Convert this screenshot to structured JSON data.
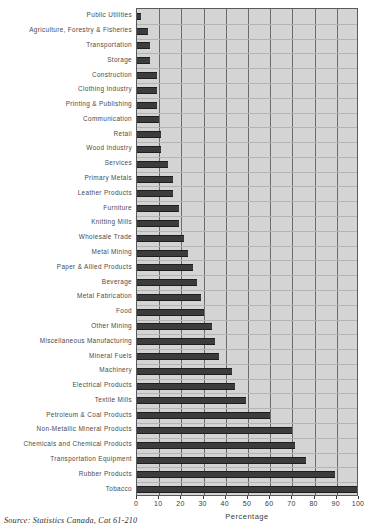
{
  "chart_data": {
    "type": "bar",
    "orientation": "horizontal",
    "title": "",
    "xlabel": "Percentage",
    "ylabel": "",
    "xlim": [
      0,
      100
    ],
    "xticks": [
      0,
      10,
      20,
      30,
      40,
      50,
      60,
      70,
      80,
      90,
      100
    ],
    "grid": true,
    "legend": null,
    "categories": [
      "Public Utilities",
      "Agriculture, Forestry & Fisheries",
      "Transportation",
      "Storage",
      "Construction",
      "Clothing Industry",
      "Printing & Publishing",
      "Communication",
      "Retail",
      "Wood Industry",
      "Services",
      "Primary Metals",
      "Leather Products",
      "Furniture",
      "Knitting Mills",
      "Wholesale Trade",
      "Metal Mining",
      "Paper & Allied Products",
      "Beverage",
      "Metal Fabrication",
      "Food",
      "Other Mining",
      "Miscellaneous Manufacturing",
      "Mineral Fuels",
      "Machinery",
      "Electrical Products",
      "Textile Mills",
      "Petroleum & Coal Products",
      "Non-Metallic Mineral Products",
      "Chemicals and Chemical Products",
      "Transportation Equipment",
      "Rubber Products",
      "Tobacco"
    ],
    "values": [
      2,
      5,
      6,
      6,
      9,
      9,
      9,
      10,
      11,
      11,
      14,
      16,
      16,
      19,
      19,
      21,
      23,
      25,
      27,
      29,
      30,
      34,
      35,
      37,
      43,
      44,
      49,
      60,
      70,
      71,
      76,
      89,
      99
    ]
  },
  "axis": {
    "percentage_label": "Percentage"
  },
  "source": {
    "note": "Source: Statistics Canada, Cat 61-210"
  },
  "colors": {
    "bar": "#3c3c3c",
    "plot_background": "#d4d4d4",
    "gridline": "#6b6b6b",
    "axis": "#3a3a3a",
    "label_text": "#4a4a4a"
  }
}
